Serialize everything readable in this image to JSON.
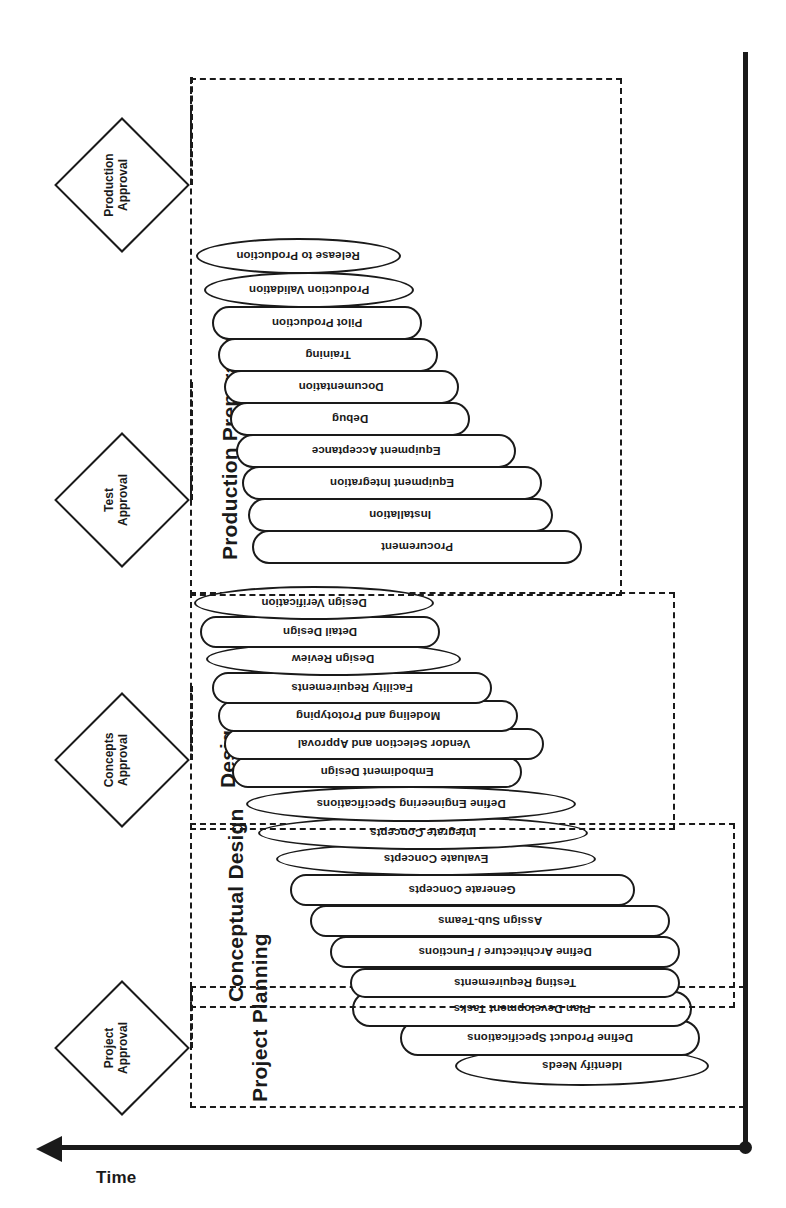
{
  "diagram": {
    "axis": {
      "time_label": "Time"
    },
    "phases": [
      {
        "id": "project-planning",
        "label": "Project Planning",
        "tasks": [
          {
            "label": "Identify Needs",
            "shape": "ellipse"
          },
          {
            "label": "Define Product Specifications",
            "shape": "round"
          },
          {
            "label": "Plan Development Tasks",
            "shape": "round"
          }
        ]
      },
      {
        "id": "conceptual-design",
        "label": "Conceptual Design",
        "tasks": [
          {
            "label": "Testing Requirements",
            "shape": "round"
          },
          {
            "label": "Define Architecture / Functions",
            "shape": "round"
          },
          {
            "label": "Assign Sub-Teams",
            "shape": "round"
          },
          {
            "label": "Generate Concepts",
            "shape": "round"
          },
          {
            "label": "Evaluate Concepts",
            "shape": "ellipse"
          },
          {
            "label": "Integrate Concepts",
            "shape": "ellipse"
          }
        ]
      },
      {
        "id": "design",
        "label": "Design",
        "tasks": [
          {
            "label": "Define Engineering Specifications",
            "shape": "ellipse"
          },
          {
            "label": "Embodiment Design",
            "shape": "round"
          },
          {
            "label": "Vendor Selection and Approval",
            "shape": "round"
          },
          {
            "label": "Modeling and Prototyping",
            "shape": "round"
          },
          {
            "label": "Facility Requirements",
            "shape": "round"
          },
          {
            "label": "Design Review",
            "shape": "ellipse"
          },
          {
            "label": "Detail Design",
            "shape": "round"
          },
          {
            "label": "Design Verification",
            "shape": "ellipse"
          }
        ]
      },
      {
        "id": "production-preparation",
        "label": "Production Preparation",
        "tasks": [
          {
            "label": "Procurement",
            "shape": "round"
          },
          {
            "label": "Installation",
            "shape": "round"
          },
          {
            "label": "Equipment Integration",
            "shape": "round"
          },
          {
            "label": "Equipment Acceptance",
            "shape": "round"
          },
          {
            "label": "Debug",
            "shape": "round"
          },
          {
            "label": "Documentation",
            "shape": "round"
          },
          {
            "label": "Training",
            "shape": "round"
          },
          {
            "label": "Pilot Production",
            "shape": "round"
          },
          {
            "label": "Production Validation",
            "shape": "ellipse"
          },
          {
            "label": "Release to Production",
            "shape": "ellipse"
          }
        ]
      }
    ],
    "milestones": [
      {
        "id": "project-approval",
        "line1": "Project",
        "line2": "Approval"
      },
      {
        "id": "concepts-approval",
        "line1": "Concepts",
        "line2": "Approval"
      },
      {
        "id": "test-approval",
        "line1": "Test",
        "line2": "Approval"
      },
      {
        "id": "production-approval",
        "line1": "Production",
        "line2": "Approval"
      }
    ]
  }
}
